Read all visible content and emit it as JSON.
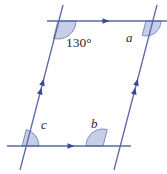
{
  "figure": {
    "colors": {
      "line": "#5a68a8",
      "arc_fill": "#c6cde6",
      "arc_stroke": "#7f8cc0",
      "arrow": "#3a4a9a",
      "text": "#2b2b36",
      "background": "#ffffff"
    },
    "lines": [
      {
        "name": "top-transversal-line",
        "x1": 47,
        "y1": 21,
        "x2": 167,
        "y2": 21,
        "marker": "single-arrow",
        "marker_at": 105
      },
      {
        "name": "bottom-transversal-line",
        "x1": 7,
        "y1": 146,
        "x2": 131,
        "y2": 146,
        "marker": "single-arrow",
        "marker_at": 70
      },
      {
        "name": "left-parallel-line",
        "x1": 63,
        "y1": 5,
        "x2": 20,
        "y2": 170,
        "marker": "double-arrow",
        "marker_at": 0.5
      },
      {
        "name": "right-parallel-line",
        "x1": 157,
        "y1": 5,
        "x2": 114,
        "y2": 170,
        "marker": "double-arrow",
        "marker_at": 0.5
      }
    ],
    "angles": [
      {
        "name": "angle-top-left",
        "label": "130°",
        "label_kind": "measure",
        "vertex_x": 58,
        "vertex_y": 21,
        "label_x": 66,
        "label_y": 47,
        "radius": 18
      },
      {
        "name": "angle-top-right",
        "label": "a",
        "label_kind": "variable",
        "vertex_x": 146,
        "vertex_y": 21,
        "label_x": 126,
        "label_y": 42,
        "radius": 15
      },
      {
        "name": "angle-bottom-right",
        "label": "b",
        "label_kind": "variable",
        "vertex_x": 103,
        "vertex_y": 146,
        "label_x": 91,
        "label_y": 128,
        "radius": 17
      },
      {
        "name": "angle-bottom-left",
        "label": "c",
        "label_kind": "variable",
        "vertex_x": 22,
        "vertex_y": 146,
        "label_x": 41,
        "label_y": 129,
        "radius": 17
      }
    ]
  }
}
